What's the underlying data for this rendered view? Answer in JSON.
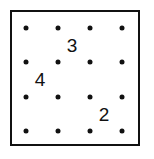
{
  "figure": {
    "name": "dot-grid-puzzle",
    "background_color": "#ffffff",
    "border_color": "#111111",
    "dot_color": "#111111",
    "number_color": "#111111",
    "box": {
      "left": 10,
      "top": 10,
      "width": 130,
      "height": 136,
      "border_width": 2
    }
  },
  "grid": {
    "rows": 4,
    "cols": 4,
    "col_x": [
      26,
      58,
      90,
      122
    ],
    "row_y": [
      28,
      62,
      97,
      131
    ],
    "dot_radius": 2.5,
    "dots": [
      {
        "row": 1,
        "col": 1,
        "x": 26,
        "y": 28
      },
      {
        "row": 1,
        "col": 2,
        "x": 58,
        "y": 28
      },
      {
        "row": 1,
        "col": 3,
        "x": 90,
        "y": 28
      },
      {
        "row": 1,
        "col": 4,
        "x": 122,
        "y": 28
      },
      {
        "row": 2,
        "col": 1,
        "x": 26,
        "y": 62
      },
      {
        "row": 2,
        "col": 2,
        "x": 58,
        "y": 62
      },
      {
        "row": 2,
        "col": 3,
        "x": 90,
        "y": 62
      },
      {
        "row": 2,
        "col": 4,
        "x": 122,
        "y": 62
      },
      {
        "row": 3,
        "col": 1,
        "x": 26,
        "y": 97
      },
      {
        "row": 3,
        "col": 2,
        "x": 58,
        "y": 97
      },
      {
        "row": 3,
        "col": 3,
        "x": 90,
        "y": 97
      },
      {
        "row": 3,
        "col": 4,
        "x": 122,
        "y": 97
      },
      {
        "row": 4,
        "col": 1,
        "x": 26,
        "y": 131
      },
      {
        "row": 4,
        "col": 2,
        "x": 58,
        "y": 131
      },
      {
        "row": 4,
        "col": 3,
        "x": 90,
        "y": 131
      },
      {
        "row": 4,
        "col": 4,
        "x": 122,
        "y": 131
      }
    ]
  },
  "numbers": [
    {
      "label": "3",
      "x": 72,
      "y": 45,
      "font_size": 19
    },
    {
      "label": "4",
      "x": 40,
      "y": 79,
      "font_size": 19
    },
    {
      "label": "2",
      "x": 104,
      "y": 114,
      "font_size": 19
    }
  ]
}
